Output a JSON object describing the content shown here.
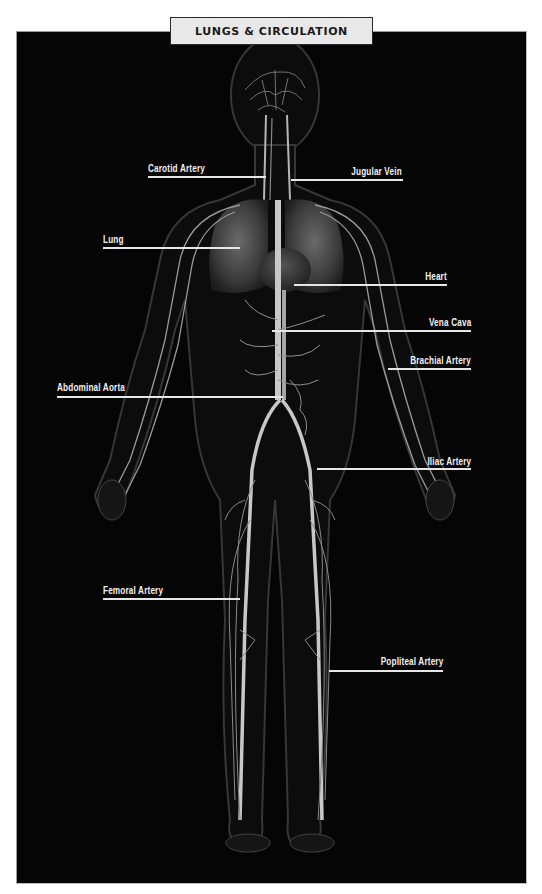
{
  "title": "LUNGS & CIRCULATION",
  "colors": {
    "background": "#050505",
    "title_box": "#e8e8e8",
    "title_border": "#2a2a2a",
    "label_text": "#f2f2f2",
    "vessels": "#bfbfbf"
  },
  "labels": [
    {
      "id": "carotid-artery",
      "text": "Carotid Artery",
      "side": "left"
    },
    {
      "id": "jugular-vein",
      "text": "Jugular Vein",
      "side": "right"
    },
    {
      "id": "lung",
      "text": "Lung",
      "side": "left"
    },
    {
      "id": "heart",
      "text": "Heart",
      "side": "right"
    },
    {
      "id": "vena-cava",
      "text": "Vena Cava",
      "side": "right"
    },
    {
      "id": "brachial-artery",
      "text": "Brachial Artery",
      "side": "right"
    },
    {
      "id": "abdominal-aorta",
      "text": "Abdominal Aorta",
      "side": "left"
    },
    {
      "id": "iliac-artery",
      "text": "Iliac Artery",
      "side": "right"
    },
    {
      "id": "femoral-artery",
      "text": "Femoral Artery",
      "side": "left"
    },
    {
      "id": "popliteal-artery",
      "text": "Popliteal Artery",
      "side": "right"
    }
  ]
}
